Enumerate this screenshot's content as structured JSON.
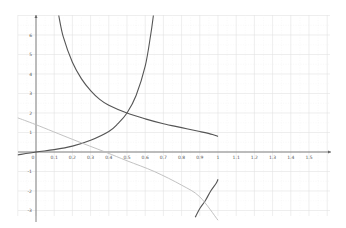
{
  "chart_data": {
    "type": "line",
    "title": "",
    "xlabel": "",
    "ylabel": "",
    "xlim": [
      -0.1,
      1.6
    ],
    "ylim": [
      -3.3,
      7.0
    ],
    "grid": true,
    "legend": null,
    "x_ticks": [
      "0",
      "0.1",
      "0.2",
      "0.3",
      "0.4",
      "0.5",
      "0.6",
      "0.7",
      "0.8",
      "0.9",
      "1",
      "1.1",
      "1.2",
      "1.3",
      "1.4",
      "1.5"
    ],
    "y_ticks": [
      "6",
      "5",
      "4",
      "3",
      "2",
      "1",
      "-1",
      "-2",
      "-3"
    ],
    "series": [
      {
        "name": "increasing-curve",
        "color": "#555555",
        "points": [
          [
            -0.1,
            -0.15
          ],
          [
            0,
            0
          ],
          [
            0.1,
            0.12
          ],
          [
            0.2,
            0.3
          ],
          [
            0.3,
            0.6
          ],
          [
            0.4,
            1.05
          ],
          [
            0.45,
            1.45
          ],
          [
            0.5,
            2.0
          ],
          [
            0.55,
            2.9
          ],
          [
            0.6,
            4.4
          ],
          [
            0.63,
            6.0
          ],
          [
            0.645,
            7.0
          ]
        ]
      },
      {
        "name": "decreasing-curve",
        "color": "#555555",
        "points": [
          [
            0.125,
            7.0
          ],
          [
            0.15,
            5.9
          ],
          [
            0.2,
            4.6
          ],
          [
            0.25,
            3.75
          ],
          [
            0.3,
            3.15
          ],
          [
            0.35,
            2.7
          ],
          [
            0.4,
            2.4
          ],
          [
            0.5,
            2.0
          ],
          [
            0.6,
            1.7
          ],
          [
            0.7,
            1.45
          ],
          [
            0.8,
            1.25
          ],
          [
            0.9,
            1.05
          ],
          [
            0.97,
            0.9
          ],
          [
            1.0,
            0.8
          ]
        ]
      },
      {
        "name": "lower-branch-curve",
        "color": "#555555",
        "points": [
          [
            1.0,
            -1.4
          ],
          [
            0.99,
            -1.6
          ],
          [
            0.96,
            -2.0
          ],
          [
            0.93,
            -2.5
          ],
          [
            0.9,
            -2.9
          ],
          [
            0.875,
            -3.35
          ]
        ]
      },
      {
        "name": "light-line",
        "color": "#bbbbbb",
        "points": [
          [
            -0.1,
            1.75
          ],
          [
            0.0,
            1.4
          ],
          [
            0.2,
            0.65
          ],
          [
            0.38,
            0.0
          ],
          [
            0.5,
            -0.45
          ],
          [
            0.65,
            -1.0
          ],
          [
            0.8,
            -1.7
          ],
          [
            0.9,
            -2.3
          ],
          [
            1.0,
            -3.5
          ]
        ]
      }
    ]
  }
}
